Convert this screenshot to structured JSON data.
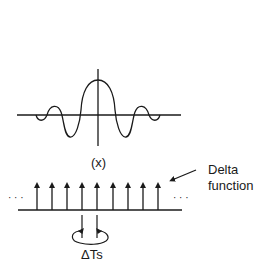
{
  "diagram": {
    "sinc_panel": {
      "label": "(x)",
      "description": "sinc-like waveform centered on vertical axis"
    },
    "impulse_panel": {
      "left_ellipsis": "· · ·",
      "right_ellipsis": "· · ·",
      "impulse_count": 9,
      "callout_line1": "Delta",
      "callout_line2": "function",
      "spacing_label": "ΔTs"
    },
    "colors": {
      "stroke": "#1a1a1a",
      "background": "#ffffff"
    }
  }
}
